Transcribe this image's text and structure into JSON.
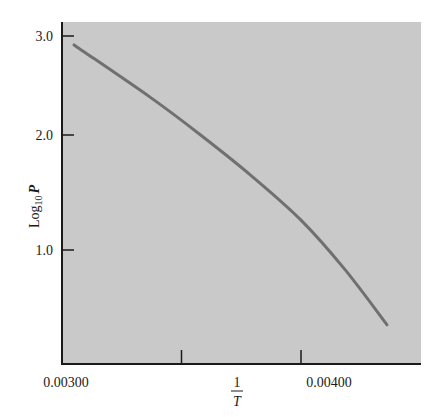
{
  "chart_data": {
    "type": "line",
    "title": "",
    "xlabel": "1/T",
    "xlabel_numerator": "1",
    "xlabel_denominator": "T",
    "ylabel": "Log10 P",
    "ylabel_base": "Log",
    "ylabel_sub": "10",
    "ylabel_var": "P",
    "xlim": [
      0.003,
      0.0045
    ],
    "ylim": [
      0.0,
      3.2
    ],
    "grid": false,
    "legend": null,
    "x_ticks": [
      0.0035,
      0.004
    ],
    "x_tick_labels": [
      {
        "value": 0.003,
        "label": "0.00300"
      },
      {
        "value": 0.004,
        "label": "0.00400"
      }
    ],
    "y_ticks": [
      {
        "value": 3.0,
        "label": "3.0"
      },
      {
        "value": 2.0,
        "label": "2.0"
      },
      {
        "value": 1.0,
        "label": "1.0"
      }
    ],
    "series": [
      {
        "name": "Log10 P vs 1/T",
        "x": [
          0.00305,
          0.00337,
          0.00358,
          0.00379,
          0.004,
          0.00418,
          0.00436
        ],
        "y": [
          2.91,
          2.38,
          2.0,
          1.65,
          1.26,
          0.84,
          0.35
        ]
      }
    ],
    "colors": {
      "plot_background": "#c9c9c9",
      "curve": "#707070",
      "axis": "#1a1a1a"
    }
  }
}
